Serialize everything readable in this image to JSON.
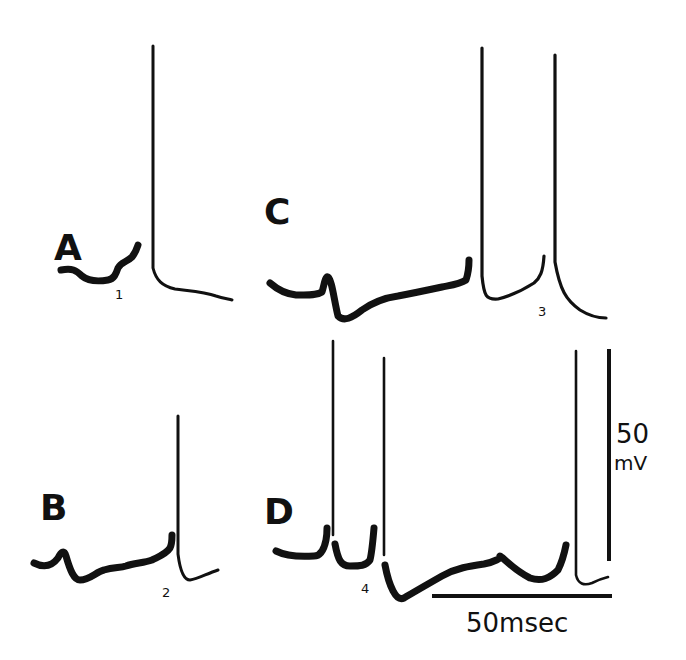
{
  "figure": {
    "panels": [
      {
        "letter": "A",
        "letter_pos": [
          56,
          248
        ],
        "event_label": "1",
        "event_label_pos": [
          117,
          296
        ],
        "baseline_path": "M 61 270 C 72 268 76 270 82 276 C 88 281 96 282 108 280 C 114 279 116 274 118 268 C 121 262 127 262 132 257 C 136 252 137 248 138 245",
        "spike_path": "M 153 268 L 153 46 M 153 268 C 156 280 162 286 175 289 C 190 291 205 292 216 296 C 222 298 228 299 232 300",
        "spike_peak_y": 46
      },
      {
        "letter": "B",
        "letter_pos": [
          40,
          520
        ],
        "event_label": "2",
        "event_label_pos": [
          163,
          594
        ],
        "baseline_path": "M 34 563 C 44 568 52 566 58 558 C 61 552 64 549 66 556 C 70 570 74 580 80 580 C 90 580 96 572 104 570 C 114 567 120 568 126 566 C 134 563 144 563 152 560 C 160 556 166 554 170 548 C 172 544 172 538 172 535",
        "spike_path": "M 178 554 L 178 416 M 178 554 C 180 570 184 580 190 580 C 198 579 206 574 218 570",
        "spike_peak_y": 416
      },
      {
        "letter": "C",
        "letter_pos": [
          266,
          222
        ],
        "event_label": "3",
        "event_label_pos": [
          540,
          313
        ],
        "baseline_path": "M 270 283 C 278 290 286 294 296 295 C 306 295 316 296 322 292 C 324 286 325 276 328 277 C 332 280 334 300 338 316 C 344 322 352 318 362 310 C 372 303 384 298 398 296 C 414 293 428 290 442 287 C 452 285 460 284 466 280 C 468 274 469 266 469 260",
        "spike_path": "M 482 276 L 482 48 M 482 276 C 484 296 486 300 498 299 C 510 296 520 292 534 283 C 540 278 543 272 544 256 M 555 262 L 555 55 M 555 262 C 560 290 566 300 580 310 C 588 315 596 318 606 318",
        "spike_peak_y": 48
      },
      {
        "letter": "D",
        "letter_pos": [
          266,
          522
        ],
        "event_label": "4",
        "event_label_pos": [
          364,
          591
        ],
        "baseline_path": "M 276 551 C 286 556 300 557 314 556 C 320 556 324 550 326 540 C 327 535 327 530 327 528 M 335 544 C 338 560 341 566 350 566 C 360 566 366 566 370 560 C 372 552 373 540 374 528 M 385 565 C 389 586 396 602 404 598 C 414 592 428 584 442 576 C 456 568 470 566 484 564 C 494 562 502 558 500 556 C 506 560 514 570 530 578 C 542 582 550 578 558 570 C 562 562 564 555 566 545",
        "spike_path": "M 333 535 L 333 341 M 384 555 L 384 358 M 576 575 L 576 351 M 576 575 C 578 584 584 586 592 583 C 598 580 604 578 608 577",
        "spike_peak_y": 341
      }
    ],
    "scale_bars": {
      "voltage": {
        "label_value": "50",
        "label_unit": "mV",
        "x": 609,
        "y1": 349,
        "y2": 561
      },
      "time": {
        "label": "50msec",
        "x1": 432,
        "x2": 612,
        "y": 596
      }
    }
  }
}
